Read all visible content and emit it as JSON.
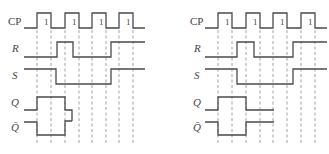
{
  "figure": {
    "colors": {
      "signal": "#4a4a4a",
      "dashed": "#8a8a8a",
      "background": "#ffffff"
    },
    "pulse_label": "1",
    "diagrams": [
      {
        "id": "left",
        "labels": [
          {
            "text": "CP",
            "x": 8,
            "y": 25,
            "italic": false
          },
          {
            "text": "R",
            "x": 12,
            "y": 52,
            "italic": true
          },
          {
            "text": "S",
            "x": 12,
            "y": 79,
            "italic": true
          },
          {
            "text": "Q",
            "x": 11,
            "y": 106,
            "italic": true
          },
          {
            "text": "Q̄",
            "x": 11,
            "y": 131,
            "italic": true
          }
        ],
        "dashed_x": [
          37,
          51,
          65,
          79,
          92,
          106,
          119,
          133
        ],
        "dash_y": [
          30,
          144
        ],
        "pulse_label_pos": [
          [
            44,
            25
          ],
          [
            72,
            25
          ],
          [
            99,
            25
          ],
          [
            126,
            25
          ]
        ],
        "waveforms": {
          "CP": "M24 28 H37 V13 H51 V28 H65 V13 H79 V28 H92 V13 H106 V28 H119 V13 H133 V28 H145",
          "R": "M24 57 H57 V42 H73 V57 H111 V42 H145",
          "S": "M24 69 H56 V84 H111 V69 H145",
          "Q": "M24 110 H37 V97 H65 V110 H72 V121",
          "Qbar": "M24 122 H37 V135 H65 V121 H72"
        }
      },
      {
        "id": "right",
        "labels": [
          {
            "text": "CP",
            "x": 190,
            "y": 25,
            "italic": false
          },
          {
            "text": "R",
            "x": 194,
            "y": 52,
            "italic": true
          },
          {
            "text": "S",
            "x": 194,
            "y": 79,
            "italic": true
          },
          {
            "text": "Q",
            "x": 193,
            "y": 106,
            "italic": true
          },
          {
            "text": "Q̄",
            "x": 193,
            "y": 131,
            "italic": true
          }
        ],
        "dashed_x": [
          218,
          232,
          246,
          260,
          273,
          287,
          301,
          315
        ],
        "dash_y": [
          30,
          144
        ],
        "pulse_label_pos": [
          [
            225,
            25
          ],
          [
            253,
            25
          ],
          [
            280,
            25
          ],
          [
            308,
            25
          ]
        ],
        "waveforms": {
          "CP": "M205 28 H218 V13 H232 V28 H246 V13 H260 V28 H273 V13 H287 V28 H301 V13 H315 V28 H327",
          "R": "M205 57 H237 V42 H254 V57 H293 V42 H327",
          "S": "M205 69 H237 V84 H293 V69 H327",
          "Q": "M205 110 H218 V97 H246 V110 H274",
          "Qbar": "M205 122 H218 V135 H246 V122 H274"
        }
      }
    ]
  }
}
